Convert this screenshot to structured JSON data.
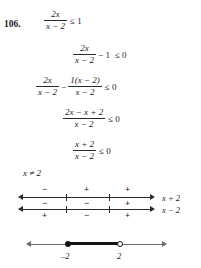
{
  "problem": {
    "number": "106."
  },
  "steps": {
    "s1": {
      "num": "2x",
      "den": "x − 2",
      "rel": "≤ 1"
    },
    "s2": {
      "num": "2x",
      "den": "x − 2",
      "op": "− 1",
      "rel": "≤ 0"
    },
    "s3": {
      "num1": "2x",
      "den1": "x − 2",
      "op": "−",
      "num2": "1(x − 2)",
      "den2": "x − 2",
      "rel": "≤ 0"
    },
    "s4": {
      "num": "2x − x + 2",
      "den": "x − 2",
      "rel": "≤ 0"
    },
    "s5": {
      "num": "x + 2",
      "den": "x − 2",
      "rel": "≤ 0"
    },
    "restriction": "x ≠ 2"
  },
  "sign_chart": {
    "line1": {
      "label": "x + 2",
      "signs_above": [
        "−",
        "+",
        "+"
      ]
    },
    "line2": {
      "label": "x − 2",
      "signs_above": [
        "−",
        "−",
        "+"
      ],
      "signs_below": [
        "+",
        "−",
        "+"
      ]
    }
  },
  "solution_line": {
    "left_point": "–2",
    "right_point": "2",
    "left_endpoint_type": "closed",
    "right_endpoint_type": "open"
  },
  "colors": {
    "ink": "#1b1b1b",
    "rule": "#2b2b2b",
    "axis_gray": "#6d6d6d",
    "bold_segment": "#151515",
    "background": "#ffffff"
  }
}
